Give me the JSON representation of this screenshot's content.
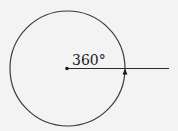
{
  "diagram": {
    "type": "full-rotation-angle",
    "angle_label": "360°",
    "colors": {
      "background": "#f3f3f3",
      "stroke": "#3a3a3a",
      "ray": "#2a2a2a",
      "text": "#1a1a1a"
    }
  }
}
